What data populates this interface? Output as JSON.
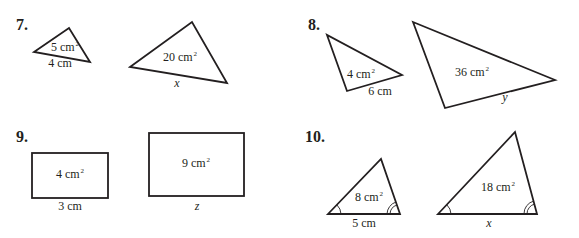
{
  "problems": [
    {
      "number": "7.",
      "small_shape": {
        "type": "triangle",
        "area_value": "5",
        "area_unit": "cm",
        "area_exp": "2",
        "side_label": "4 cm"
      },
      "large_shape": {
        "type": "triangle",
        "area_value": "20",
        "area_unit": "cm",
        "area_exp": "2",
        "side_label": "x"
      }
    },
    {
      "number": "8.",
      "small_shape": {
        "type": "triangle",
        "area_value": "4",
        "area_unit": "cm",
        "area_exp": "2",
        "side_label": "6 cm"
      },
      "large_shape": {
        "type": "triangle",
        "area_value": "36",
        "area_unit": "cm",
        "area_exp": "2",
        "side_label": "y"
      }
    },
    {
      "number": "9.",
      "small_shape": {
        "type": "rectangle",
        "area_value": "4",
        "area_unit": "cm",
        "area_exp": "2",
        "side_label": "3 cm"
      },
      "large_shape": {
        "type": "rectangle",
        "area_value": "9",
        "area_unit": "cm",
        "area_exp": "2",
        "side_label": "z"
      }
    },
    {
      "number": "10.",
      "small_shape": {
        "type": "triangle",
        "area_value": "8",
        "area_unit": "cm",
        "area_exp": "2",
        "side_label": "5 cm",
        "angle_marks": [
          "single-arc",
          "double-arc"
        ]
      },
      "large_shape": {
        "type": "triangle",
        "area_value": "18",
        "area_unit": "cm",
        "area_exp": "2",
        "side_label": "x",
        "angle_marks": [
          "single-arc",
          "double-arc"
        ]
      }
    }
  ]
}
